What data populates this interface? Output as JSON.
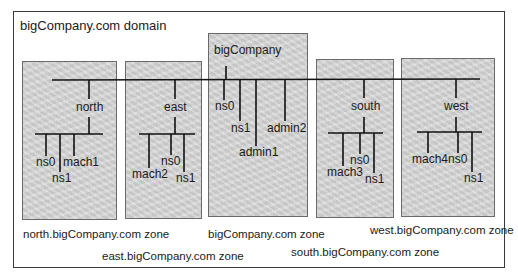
{
  "domain_title": "bigCompany.com domain",
  "zones": {
    "north": {
      "label": "north.bigCompany.com zone",
      "hub": "north",
      "hosts": [
        "ns0",
        "ns1",
        "mach1"
      ]
    },
    "east": {
      "label": "east.bigCompany.com zone",
      "hub": "east",
      "hosts": [
        "mach2",
        "ns0",
        "ns1"
      ]
    },
    "root": {
      "label": "bigCompany.com zone",
      "hub": "bigCompany",
      "hosts": [
        "ns0",
        "ns1",
        "admin1",
        "admin2"
      ]
    },
    "south": {
      "label": "south.bigCompany.com zone",
      "hub": "south",
      "hosts": [
        "mach3",
        "ns0",
        "ns1"
      ]
    },
    "west": {
      "label": "west.bigCompany.com zone",
      "hub": "west",
      "hosts": [
        "mach4",
        "ns0",
        "ns1"
      ]
    }
  },
  "colors": {
    "zone_fill": "#d4d4d4",
    "line": "#111111",
    "frame": "#3a3a3a"
  }
}
